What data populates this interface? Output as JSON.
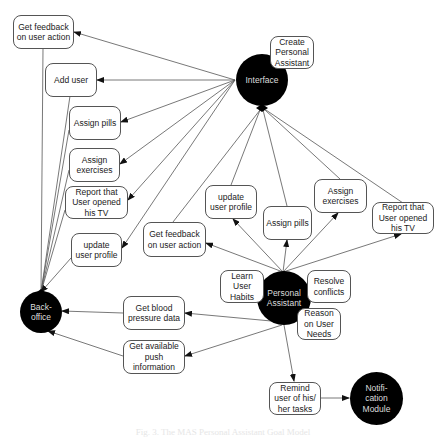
{
  "agents": {
    "interface": {
      "label": "Interface"
    },
    "back_office": {
      "label": "Back-\noffice"
    },
    "personal_assistant": {
      "label": "Personal\nAssistant"
    },
    "notification_module": {
      "label": "Notifi-\ncation\nModule"
    }
  },
  "goals": {
    "create_pa": "Create\nPersonal\nAssistant",
    "left_get_feedback": "Get feedback\non user action",
    "left_add_user": "Add user",
    "left_assign_pills": "Assign pills",
    "left_assign_exercises": "Assign\nexercises",
    "left_report_tv": "Report that\nUser opened\nhis TV",
    "left_update_profile": "update\nuser profile",
    "mid_update_profile": "update\nuser profile",
    "mid_assign_pills": "Assign pills",
    "mid_assign_exercises": "Assign\nexercises",
    "mid_report_tv": "Report that\nUser opened\nhis TV",
    "mid_get_feedback": "Get feedback\non user action",
    "learn_habits": "Learn\nUser\nHabits",
    "resolve_conflicts": "Resolve\nconflicts",
    "reason_needs": "Reason\non User\nNeeds",
    "blood_pressure": "Get blood\npressure data",
    "push_info": "Get available\npush\ninformation",
    "remind_tasks": "Remind\nuser of his/\nher tasks"
  },
  "caption": "Fig. 3. The MAS Personal Assistant Goal Model",
  "colors": {
    "agent_fill": "#000000",
    "line": "#555555",
    "box_border": "#555555"
  }
}
